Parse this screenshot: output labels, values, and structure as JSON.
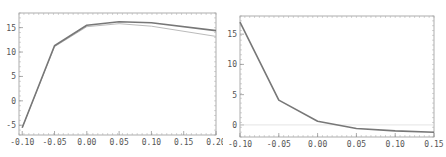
{
  "chart_data": [
    {
      "type": "line",
      "title": "",
      "xlabel": "",
      "ylabel": "",
      "xlim": [
        -0.105,
        0.2
      ],
      "ylim": [
        -7,
        18
      ],
      "x_ticks": [
        -0.1,
        -0.05,
        0.0,
        0.05,
        0.1,
        0.15,
        0.2
      ],
      "x_tick_labels": [
        "-0.10",
        "-0.05",
        "0.00",
        "0.05",
        "0.10",
        "0.15",
        "0.20"
      ],
      "y_ticks": [
        -5,
        0,
        5,
        10,
        15
      ],
      "y_tick_labels": [
        "-5",
        "0",
        "5",
        "10",
        "15"
      ],
      "grid": false,
      "frame": true,
      "series": [
        {
          "name": "series-dark",
          "color": "#777777",
          "x": [
            -0.1,
            -0.05,
            0.0,
            0.05,
            0.1,
            0.2
          ],
          "values": [
            -5.5,
            11.3,
            15.5,
            16.2,
            16.0,
            14.4
          ]
        },
        {
          "name": "series-light",
          "color": "#bbbbbb",
          "x": [
            -0.1,
            -0.05,
            0.0,
            0.05,
            0.1,
            0.2
          ],
          "values": [
            -5.5,
            11.1,
            15.2,
            15.8,
            15.3,
            13.2
          ]
        }
      ]
    },
    {
      "type": "line",
      "title": "",
      "xlabel": "",
      "ylabel": "",
      "xlim": [
        -0.1,
        0.15
      ],
      "ylim": [
        -2,
        18
      ],
      "x_ticks": [
        -0.1,
        -0.05,
        0.0,
        0.05,
        0.1,
        0.15
      ],
      "x_tick_labels": [
        "-0.10",
        "-0.05",
        "0.00",
        "0.05",
        "0.10",
        "0.15"
      ],
      "y_ticks": [
        0,
        5,
        10,
        15
      ],
      "y_tick_labels": [
        "0",
        "5",
        "10",
        "15"
      ],
      "grid": false,
      "frame": true,
      "reference_line": {
        "y": 0,
        "color": "#dddddd"
      },
      "series": [
        {
          "name": "series-main",
          "color": "#777777",
          "x": [
            -0.1,
            -0.05,
            0.0,
            0.05,
            0.1,
            0.15
          ],
          "values": [
            17.0,
            4.1,
            0.6,
            -0.6,
            -1.0,
            -1.2
          ]
        }
      ]
    }
  ]
}
